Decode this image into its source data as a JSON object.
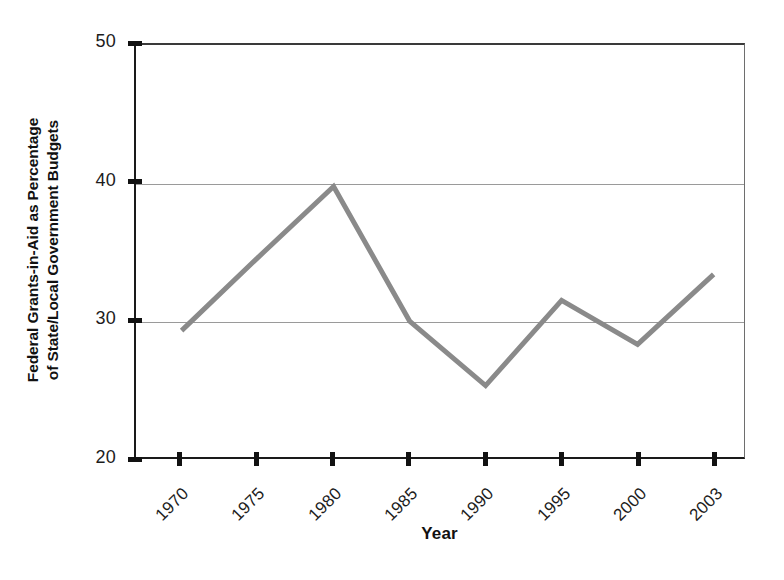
{
  "chart_data": {
    "type": "line",
    "title": "",
    "subtitle": "",
    "xlabel": "Year",
    "ylabel": "Federal Grants-in-Aid as Percentage of State/Local Government Budgets",
    "ylabel_lines": [
      "Federal Grants-in-Aid as Percentage",
      "of State/Local Government Budgets"
    ],
    "categories": [
      "1970",
      "1975",
      "1980",
      "1985",
      "1990",
      "1995",
      "2000",
      "2003"
    ],
    "values": [
      29.2,
      34.5,
      39.7,
      29.9,
      25.2,
      31.4,
      28.2,
      33.3
    ],
    "series": [
      {
        "name": "Federal grants-in-aid share",
        "values": [
          29.2,
          34.5,
          39.7,
          29.9,
          25.2,
          31.4,
          28.2,
          33.3
        ]
      }
    ],
    "ylim": [
      20,
      50
    ],
    "yticks": [
      20,
      30,
      40,
      50
    ],
    "ytick_labels": [
      "20",
      "30",
      "40",
      "50"
    ],
    "gridlines_y": [
      30,
      40
    ],
    "grid": "horizontal-only",
    "legend": "none",
    "legend_position": "none",
    "xtick_rotation": -45,
    "line_color": "#8a8a8a",
    "line_width": 5,
    "axis_color": "#1a1a1a",
    "grid_color": "#9a9a9a",
    "plot_background": "#ffffff",
    "figure_background": "#ffffff",
    "markers": "none",
    "annotations": []
  }
}
